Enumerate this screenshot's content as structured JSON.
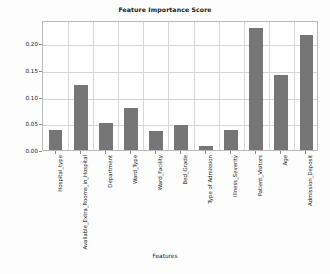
{
  "chart_data": {
    "type": "bar",
    "title": "Feature Importance Score",
    "xlabel": "Features",
    "ylabel": "",
    "ylim": [
      0,
      0.2435
    ],
    "grid": true,
    "legend": false,
    "bar_color": "#767676",
    "categories": [
      "Hospital_type",
      "Available_Extra_Rooms_in_Hospital",
      "Department",
      "Ward_Type",
      "Ward_Facility",
      "Bed_Grade",
      "Type of Admission",
      "Illness_Severity",
      "Patient_Visitors",
      "Age",
      "Admission_Deposit"
    ],
    "values": [
      0.038,
      0.122,
      0.05,
      0.078,
      0.036,
      0.046,
      0.008,
      0.037,
      0.228,
      0.141,
      0.215
    ],
    "ytick_labels": [
      "0.00",
      "0.05",
      "0.10",
      "0.15",
      "0.20"
    ],
    "ytick_values": [
      0.0,
      0.05,
      0.1,
      0.15,
      0.2
    ]
  }
}
